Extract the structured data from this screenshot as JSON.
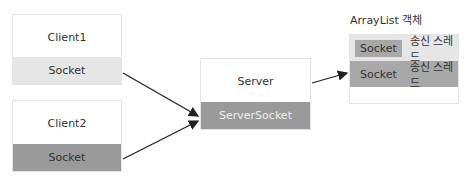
{
  "clients": [
    {
      "name": "Client1",
      "socket": "Socket",
      "socket_color": "#e6e6e6"
    },
    {
      "name": "Client2",
      "socket": "Socket",
      "socket_color": "#9a9a9a"
    }
  ],
  "server": {
    "name": "Server",
    "socket": "ServerSocket",
    "socket_color": "#9a9a9a"
  },
  "arraylist": {
    "title": "ArrayList 객체",
    "rows": [
      {
        "socket": "Socket",
        "thread": "송신 스레드",
        "color": "#e6e6e6"
      },
      {
        "socket": "Socket",
        "thread": "송신 스레드",
        "color": "#a8a8a8"
      }
    ]
  }
}
